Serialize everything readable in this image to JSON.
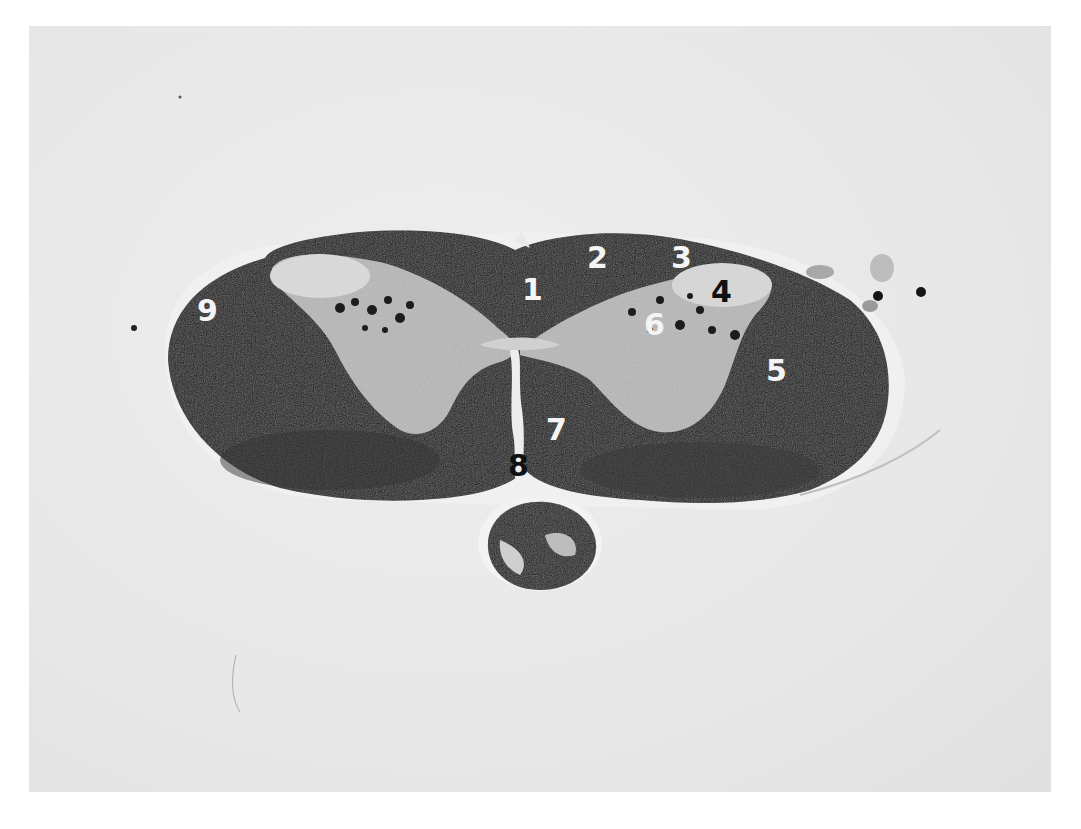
{
  "image": {
    "subject": "Stained transverse section of spinal cord with numbered anatomical labels",
    "background_color": "#e9e9e9",
    "tissue_dark_color": "#141414",
    "tissue_light_color": "#bdbdbd"
  },
  "labels": [
    {
      "id": "1",
      "text": "1",
      "color": "white",
      "x": 522,
      "y": 275
    },
    {
      "id": "2",
      "text": "2",
      "color": "white",
      "x": 587,
      "y": 243
    },
    {
      "id": "3",
      "text": "3",
      "color": "white",
      "x": 671,
      "y": 243
    },
    {
      "id": "4",
      "text": "4",
      "color": "black",
      "x": 711,
      "y": 277
    },
    {
      "id": "5",
      "text": "5",
      "color": "white",
      "x": 766,
      "y": 356
    },
    {
      "id": "6",
      "text": "6",
      "color": "white",
      "x": 644,
      "y": 310
    },
    {
      "id": "7",
      "text": "7",
      "color": "white",
      "x": 546,
      "y": 415
    },
    {
      "id": "8",
      "text": "8",
      "color": "black",
      "x": 508,
      "y": 451
    },
    {
      "id": "9",
      "text": "9",
      "color": "white",
      "x": 197,
      "y": 296
    }
  ]
}
